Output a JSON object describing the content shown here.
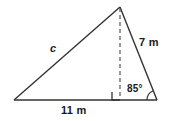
{
  "figure": {
    "type": "triangle-with-altitude-diagram",
    "stroke_color": "#333333",
    "background_color": "#ffffff",
    "labels": {
      "hypotenuse": "c",
      "right_side": "7 m",
      "angle": "85°",
      "base": "11 m"
    },
    "geometry": {
      "vertices": {
        "left": [
          14,
          100
        ],
        "apex": [
          120,
          7
        ],
        "right": [
          157,
          100
        ]
      },
      "altitude_foot": [
        120,
        100
      ],
      "right_angle_marker": {
        "x": 112,
        "y": 92,
        "size": 8
      },
      "angle_arc": {
        "center": [
          157,
          100
        ],
        "radius": 10,
        "value_degrees": 85
      }
    }
  }
}
